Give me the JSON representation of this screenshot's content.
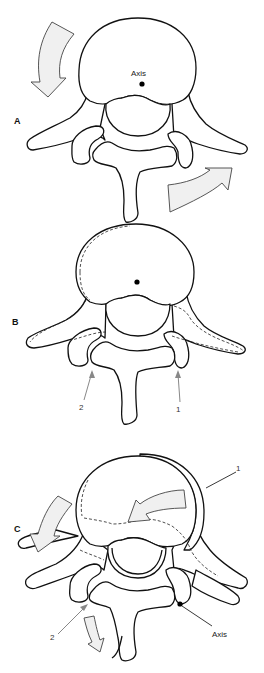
{
  "figure": {
    "panels": [
      {
        "id": "A",
        "label": "A",
        "annotations": {
          "axis_label": "Axis"
        }
      },
      {
        "id": "B",
        "label": "B",
        "annotations": {
          "pointer_1": "1",
          "pointer_2": "2"
        }
      },
      {
        "id": "C",
        "label": "C",
        "annotations": {
          "pointer_1": "1",
          "pointer_2": "2",
          "axis_label": "Axis"
        }
      }
    ]
  },
  "colors": {
    "outline": "#111111",
    "arrow_fill": "#f0f0f0",
    "pointer_gray": "#888888",
    "background": "#ffffff"
  }
}
